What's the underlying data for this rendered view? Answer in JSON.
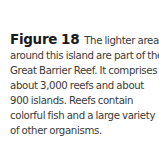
{
  "caption": {
    "label": "Figure 18",
    "lines": [
      "The lighter areas",
      "around this island are part of the",
      "Great Barrier Reef. It comprises",
      "about 3,000 reefs and about",
      "900 islands. Reefs contain",
      "colorful fish and a large variety",
      "of other organisms."
    ]
  }
}
